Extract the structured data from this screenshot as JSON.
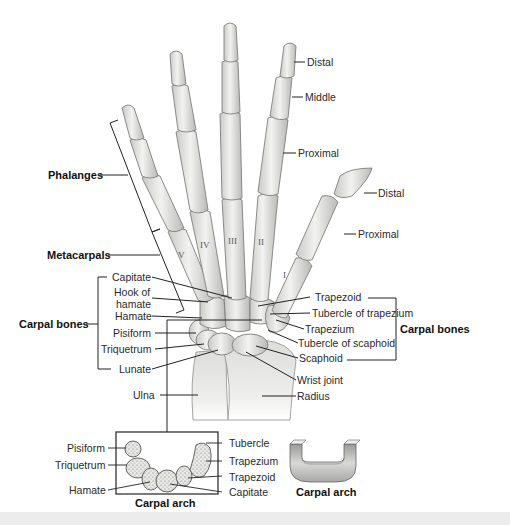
{
  "figure": {
    "colors": {
      "bone": "#e4e4e2",
      "bone_shade": "#b8b8b6",
      "bone_outline": "#8a8a88",
      "line": "#222222",
      "text": "#2a2a2a",
      "strip": "#ececec"
    }
  },
  "labels": {
    "phalanges_group": "Phalanges",
    "metacarpals_group": "Metacarpals",
    "carpal_bones_left": "Carpal bones",
    "carpal_bones_right": "Carpal bones",
    "finger": {
      "distal": "Distal",
      "middle": "Middle",
      "proximal": "Proximal"
    },
    "thumb": {
      "distal": "Distal",
      "proximal": "Proximal"
    },
    "metacarpal_numerals": [
      "I",
      "II",
      "III",
      "IV",
      "V"
    ],
    "left_carpals": [
      "Capitate",
      "Hook of",
      "hamate",
      "Hamate",
      "Pisiform",
      "Triquetrum",
      "Lunate"
    ],
    "right_carpals": [
      "Trapezoid",
      "Tubercle of trapezium",
      "Trapezium",
      "Tubercle of scaphoid",
      "Scaphoid"
    ],
    "wrist_joint": "Wrist joint",
    "ulna": "Ulna",
    "radius": "Radius"
  },
  "inset_arch": {
    "left_labels": [
      "Pisiform",
      "Triquetrum",
      "Hamate"
    ],
    "right_labels": [
      "Tubercle",
      "Trapezium",
      "Trapezoid",
      "Capitate"
    ],
    "caption": "Carpal arch"
  },
  "schematic_arch": {
    "caption": "Carpal arch"
  }
}
